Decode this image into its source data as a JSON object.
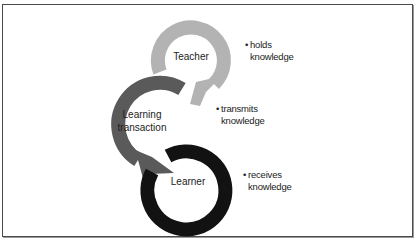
{
  "diagram": {
    "colors": {
      "teacher_ring": "#b3b3b3",
      "transaction_ring": "#5a5a5a",
      "learner_ring": "#121212",
      "frame_border": "#4a4a4a",
      "text": "#222222"
    },
    "nodes": [
      {
        "id": "teacher",
        "label": "Teacher",
        "note_bullet": "•",
        "note_line1": "holds",
        "note_line2": "knowledge"
      },
      {
        "id": "learning-transaction",
        "label_line1": "Learning",
        "label_line2": "transaction",
        "note_bullet": "•",
        "note_line1": "transmits",
        "note_line2": "knowledge"
      },
      {
        "id": "learner",
        "label": "Learner",
        "note_bullet": "•",
        "note_line1": "receives",
        "note_line2": "knowledge"
      }
    ],
    "flow": [
      "Teacher",
      "Learning transaction",
      "Learner"
    ]
  }
}
